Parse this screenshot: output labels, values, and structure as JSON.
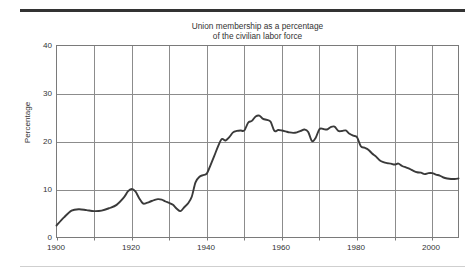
{
  "figure": {
    "title": "Union membership as a percentage\nof the civilian labor force",
    "y_axis_title": "Percentage",
    "top_rule_color": "#333333",
    "bottom_rule_color": "#cfcfcf",
    "grid_color": "#8c8c8c",
    "frame_color": "#7a7a7a",
    "line_color": "#3a3a3a",
    "background_color": "#ffffff"
  },
  "chart_data": {
    "type": "line",
    "title": "Union membership as a percentage of the civilian labor force",
    "xlabel": "",
    "ylabel": "Percentage",
    "xlim": [
      1900,
      2007
    ],
    "ylim": [
      0,
      40
    ],
    "ytick_labels": [
      "0",
      "10",
      "20",
      "30",
      "40"
    ],
    "yticks": [
      0,
      10,
      20,
      30,
      40
    ],
    "xtick_labels": [
      "1900",
      "1920",
      "1940",
      "1960",
      "1980",
      "2000"
    ],
    "xticks": [
      1900,
      1920,
      1940,
      1960,
      1980,
      2000
    ],
    "x_minor_ticks": [
      1910,
      1930,
      1950,
      1970,
      1990
    ],
    "grid": "both",
    "legend": "none",
    "series": [
      {
        "name": "Union membership (% of civilian labor force)",
        "x": [
          1900,
          1902,
          1904,
          1906,
          1908,
          1910,
          1912,
          1914,
          1916,
          1918,
          1919,
          1920,
          1921,
          1922,
          1923,
          1924,
          1925,
          1926,
          1927,
          1928,
          1929,
          1930,
          1931,
          1932,
          1933,
          1934,
          1935,
          1936,
          1937,
          1938,
          1939,
          1940,
          1941,
          1942,
          1943,
          1944,
          1945,
          1946,
          1947,
          1948,
          1949,
          1950,
          1951,
          1952,
          1953,
          1954,
          1955,
          1956,
          1957,
          1958,
          1959,
          1960,
          1961,
          1962,
          1963,
          1964,
          1965,
          1966,
          1967,
          1968,
          1969,
          1970,
          1971,
          1972,
          1973,
          1974,
          1975,
          1976,
          1977,
          1978,
          1979,
          1980,
          1981,
          1982,
          1983,
          1984,
          1985,
          1986,
          1987,
          1988,
          1989,
          1990,
          1991,
          1992,
          1993,
          1994,
          1995,
          1996,
          1997,
          1998,
          1999,
          2000,
          2001,
          2002,
          2003,
          2004,
          2005,
          2006,
          2007
        ],
        "y": [
          2.5,
          4.2,
          5.6,
          5.9,
          5.7,
          5.5,
          5.6,
          6.1,
          6.8,
          8.4,
          9.6,
          10.1,
          9.6,
          8.2,
          7.1,
          7.2,
          7.5,
          7.8,
          8.0,
          7.9,
          7.5,
          7.2,
          6.8,
          6.0,
          5.5,
          6.3,
          7.1,
          8.5,
          11.5,
          12.6,
          13.0,
          13.3,
          15.1,
          17.0,
          19.0,
          20.5,
          20.2,
          20.9,
          21.9,
          22.2,
          22.3,
          22.3,
          23.9,
          24.3,
          25.2,
          25.4,
          24.7,
          24.5,
          24.1,
          22.2,
          22.4,
          22.3,
          22.1,
          21.9,
          21.8,
          21.9,
          22.2,
          22.5,
          22.0,
          20.1,
          20.8,
          22.6,
          22.6,
          22.5,
          23.0,
          23.1,
          22.2,
          22.2,
          22.3,
          21.6,
          21.2,
          20.9,
          19.0,
          18.7,
          18.3,
          17.5,
          16.9,
          16.1,
          15.7,
          15.5,
          15.4,
          15.2,
          15.4,
          14.9,
          14.6,
          14.3,
          13.9,
          13.6,
          13.5,
          13.2,
          13.4,
          13.4,
          13.1,
          12.9,
          12.5,
          12.3,
          12.2,
          12.2,
          12.3
        ]
      }
    ]
  },
  "axes": {
    "y_ticks": [
      {
        "label": "40",
        "value": 40
      },
      {
        "label": "30",
        "value": 30
      },
      {
        "label": "20",
        "value": 20
      },
      {
        "label": "10",
        "value": 10
      },
      {
        "label": "0",
        "value": 0
      }
    ],
    "x_ticks": [
      {
        "label": "1900",
        "value": 1900
      },
      {
        "label": "1920",
        "value": 1920
      },
      {
        "label": "1940",
        "value": 1940
      },
      {
        "label": "1960",
        "value": 1960
      },
      {
        "label": "1980",
        "value": 1980
      },
      {
        "label": "2000",
        "value": 2000
      }
    ]
  }
}
